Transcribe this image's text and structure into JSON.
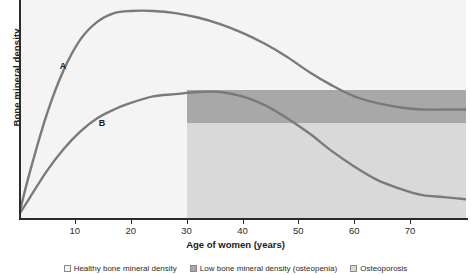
{
  "chart_data": {
    "type": "line",
    "title": "",
    "xlabel": "Age of women (years)",
    "ylabel": "Bone mineral density",
    "xlim": [
      0,
      80
    ],
    "ylim": [
      0,
      100
    ],
    "grid": false,
    "legend_position": "bottom",
    "xticks": [
      10,
      20,
      30,
      40,
      50,
      60,
      70
    ],
    "xtick_labels": [
      "10",
      "20",
      "30",
      "40",
      "50",
      "60",
      "70"
    ],
    "yticks": [],
    "ytick_labels": [],
    "series": [
      {
        "name": "A",
        "annotation": "A",
        "description": "Normal peak bone mass: rises steeply through adolescence, peaks near age 21, slowly declines after menopause, ending in the osteopenia band",
        "x": [
          0,
          2,
          5,
          8,
          11,
          14,
          17,
          20,
          24,
          28,
          32,
          36,
          40,
          44,
          48,
          52,
          56,
          60,
          64,
          68,
          72,
          76,
          80
        ],
        "y": [
          2,
          22,
          48,
          68,
          82,
          90,
          94,
          95,
          95,
          94,
          92,
          89,
          85,
          80,
          74,
          67,
          61,
          56,
          53,
          51,
          50,
          50,
          50
        ]
      },
      {
        "name": "B",
        "annotation": "B",
        "description": "Low peak bone mass: rises slowly, peaks near age 33 at the osteopenia threshold, then declines into the osteoporosis band",
        "x": [
          0,
          2,
          5,
          8,
          11,
          14,
          17,
          20,
          24,
          28,
          32,
          36,
          40,
          44,
          48,
          52,
          56,
          60,
          64,
          68,
          72,
          76,
          80
        ],
        "y": [
          2,
          10,
          22,
          32,
          40,
          46,
          50,
          53,
          56,
          57,
          58,
          58,
          56,
          52,
          46,
          39,
          31,
          24,
          18,
          14,
          11,
          10,
          9
        ]
      }
    ],
    "bands": [
      {
        "name": "healthy",
        "label": "Healthy bone mineral density",
        "color": "#f4f4f4",
        "y_range": [
          55,
          100
        ],
        "x_range": [
          0,
          80
        ]
      },
      {
        "name": "osteopenia",
        "label": "Low bone mineral density (osteopenia)",
        "color": "#a8a8a8",
        "y_range": [
          44,
          59
        ],
        "x_range": [
          30,
          80
        ]
      },
      {
        "name": "osteoporosis",
        "label": "Osteoporosis",
        "color": "#d9d9d9",
        "y_range": [
          0,
          44
        ],
        "x_range": [
          30,
          80
        ]
      }
    ],
    "annotations": [
      {
        "text": "A",
        "x": 8,
        "y": 70
      },
      {
        "text": "B",
        "x": 15,
        "y": 44
      }
    ],
    "line_color": "#7a7a7a",
    "axis_color": "#2b2b2b"
  },
  "axes": {
    "y_title": "Bone mineral density",
    "x_title": "Age of women (years)",
    "x_ticks": [
      {
        "label": "10",
        "pos": 10
      },
      {
        "label": "20",
        "pos": 20
      },
      {
        "label": "30",
        "pos": 30
      },
      {
        "label": "40",
        "pos": 40
      },
      {
        "label": "50",
        "pos": 50
      },
      {
        "label": "60",
        "pos": 60
      },
      {
        "label": "70",
        "pos": 70
      }
    ]
  },
  "curve_labels": {
    "a": "A",
    "b": "B"
  },
  "legend": {
    "items": [
      {
        "label": "Healthy bone mineral density",
        "color": "#f4f4f4"
      },
      {
        "label": "Low bone mineral density (osteopenia)",
        "color": "#a8a8a8"
      },
      {
        "label": "Osteoporosis",
        "color": "#d9d9d9"
      }
    ]
  },
  "colors": {
    "plot_background": "#f4f4f4",
    "osteopenia_band": "#a8a8a8",
    "osteoporosis_band": "#d9d9d9",
    "curve": "#7a7a7a",
    "axis": "#2b2b2b"
  }
}
